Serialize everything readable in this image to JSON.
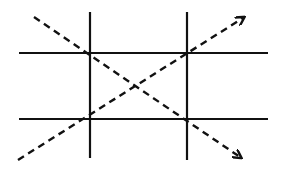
{
  "diagram": {
    "type": "line-diagram",
    "colors": {
      "stroke": "#111111",
      "background": "#ffffff"
    },
    "solid_lines": [
      {
        "id": "horizontal-top",
        "x1": 19,
        "y1": 53,
        "x2": 268,
        "y2": 53
      },
      {
        "id": "horizontal-bottom",
        "x1": 19,
        "y1": 119,
        "x2": 268,
        "y2": 119
      },
      {
        "id": "vertical-left",
        "x1": 90,
        "y1": 12,
        "x2": 90,
        "y2": 158
      },
      {
        "id": "vertical-right",
        "x1": 187,
        "y1": 12,
        "x2": 187,
        "y2": 160
      }
    ],
    "dashed_arrows": [
      {
        "id": "arrow-down-right",
        "x1": 34,
        "y1": 17,
        "x2": 240,
        "y2": 157,
        "head": "end"
      },
      {
        "id": "arrow-up-right",
        "x1": 18,
        "y1": 160,
        "x2": 243,
        "y2": 18,
        "head": "end"
      }
    ]
  }
}
